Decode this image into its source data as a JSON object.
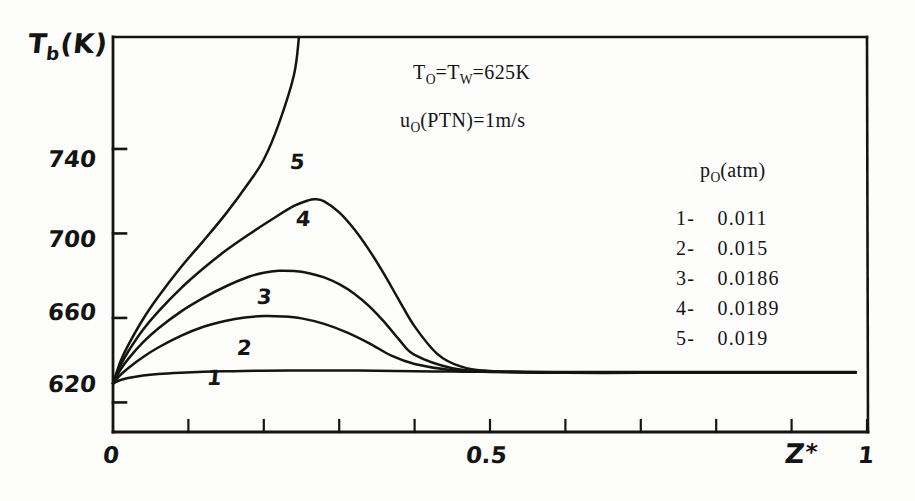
{
  "figure": {
    "background_color": "#fdfdfb",
    "ink_color": "#141414",
    "y_axis_title": "T",
    "y_axis_title_sub": "b",
    "y_axis_title_unit": "(K)",
    "x_axis_title": "Z",
    "x_axis_title_star": "*"
  },
  "annotations": {
    "line1_a": "T",
    "line1_sub_a": "O",
    "line1_b": "=T",
    "line1_sub_b": "W",
    "line1_c": "=625K",
    "line2_a": "u",
    "line2_sub_a": "O",
    "line2_b": "(PTN)=1m/s"
  },
  "legend": {
    "title_main": "p",
    "title_sub": "O",
    "title_unit": "(atm)",
    "rows": [
      {
        "key": "1-",
        "value": "0.011"
      },
      {
        "key": "2-",
        "value": "0.015"
      },
      {
        "key": "3-",
        "value": "0.0186"
      },
      {
        "key": "4-",
        "value": "0.0189"
      },
      {
        "key": "5-",
        "value": "0.019"
      }
    ]
  },
  "curve_labels": [
    {
      "id": "1",
      "x": 207,
      "y": 368
    },
    {
      "id": "2",
      "x": 237,
      "y": 338
    },
    {
      "id": "3",
      "x": 257,
      "y": 287
    },
    {
      "id": "4",
      "x": 296,
      "y": 209
    },
    {
      "id": "5",
      "x": 290,
      "y": 152
    }
  ],
  "chart_data": {
    "type": "line",
    "title": "",
    "xlabel": "Z*",
    "ylabel": "Tb (K)",
    "xlim": [
      0,
      1
    ],
    "ylim": [
      606,
      793
    ],
    "grid": false,
    "legend_position": "right",
    "xticks": [
      0,
      0.1,
      0.2,
      0.3,
      0.4,
      0.5,
      0.6,
      0.7,
      0.8,
      0.9,
      1
    ],
    "xtick_labels": [
      "0",
      "",
      "",
      "",
      "",
      "0.5",
      "",
      "",
      "",
      "",
      "1"
    ],
    "yticks": [
      620,
      660,
      700,
      740
    ],
    "ytick_labels": [
      "620",
      "660",
      "700",
      "740"
    ],
    "series": [
      {
        "name": "1",
        "legend": "1- 0.011",
        "p0_atm": 0.011,
        "x": [
          0.0,
          0.01,
          0.02,
          0.04,
          0.06,
          0.09,
          0.12,
          0.16,
          0.2,
          0.25,
          0.3,
          0.35,
          0.4,
          0.45,
          0.5,
          0.6,
          0.7,
          0.8,
          0.9,
          0.985
        ],
        "y": [
          629.0,
          630.6,
          631.6,
          632.8,
          633.5,
          634.1,
          634.5,
          634.8,
          635.0,
          635.1,
          635.1,
          635.0,
          634.8,
          634.6,
          634.5,
          634.4,
          634.4,
          634.4,
          634.4,
          634.4
        ]
      },
      {
        "name": "2",
        "legend": "2- 0.015",
        "p0_atm": 0.015,
        "x": [
          0.0,
          0.01,
          0.02,
          0.04,
          0.06,
          0.09,
          0.12,
          0.15,
          0.175,
          0.2,
          0.225,
          0.25,
          0.28,
          0.31,
          0.34,
          0.37,
          0.4,
          0.45,
          0.5,
          0.6,
          0.7,
          0.8,
          0.9,
          0.985
        ],
        "y": [
          629.0,
          633.0,
          636.2,
          641.5,
          646.0,
          651.5,
          655.8,
          658.7,
          660.2,
          660.9,
          660.7,
          659.8,
          657.2,
          653.2,
          648.0,
          642.0,
          638.2,
          635.2,
          634.4,
          634.0,
          634.0,
          634.1,
          634.1,
          634.1
        ]
      },
      {
        "name": "3",
        "legend": "3- 0.0186",
        "p0_atm": 0.0186,
        "x": [
          0.0,
          0.01,
          0.02,
          0.04,
          0.06,
          0.09,
          0.12,
          0.15,
          0.18,
          0.2,
          0.22,
          0.24,
          0.26,
          0.28,
          0.3,
          0.32,
          0.34,
          0.36,
          0.38,
          0.4,
          0.45,
          0.5,
          0.6,
          0.7,
          0.8,
          0.9,
          0.985
        ],
        "y": [
          629.0,
          635.5,
          640.5,
          648.5,
          655.0,
          663.0,
          669.5,
          675.0,
          679.5,
          681.4,
          682.3,
          682.2,
          681.2,
          679.2,
          676.0,
          671.5,
          665.5,
          658.0,
          649.5,
          642.5,
          636.2,
          634.6,
          634.2,
          634.2,
          634.3,
          634.3,
          634.3
        ]
      },
      {
        "name": "4",
        "legend": "4- 0.0189",
        "p0_atm": 0.0189,
        "x": [
          0.0,
          0.01,
          0.02,
          0.04,
          0.06,
          0.09,
          0.12,
          0.15,
          0.18,
          0.21,
          0.24,
          0.26,
          0.268,
          0.28,
          0.3,
          0.32,
          0.34,
          0.36,
          0.38,
          0.4,
          0.43,
          0.46,
          0.5,
          0.6,
          0.7,
          0.8,
          0.9,
          0.985
        ],
        "y": [
          629.0,
          637.5,
          644.0,
          654.5,
          663.0,
          674.0,
          683.5,
          692.0,
          699.5,
          706.5,
          713.0,
          715.8,
          716.2,
          715.2,
          710.0,
          702.0,
          692.0,
          680.5,
          668.0,
          656.0,
          643.0,
          637.2,
          634.9,
          634.2,
          634.2,
          634.2,
          634.2,
          634.2
        ]
      },
      {
        "name": "5",
        "legend": "5- 0.019",
        "p0_atm": 0.019,
        "note": "rises off the top of the plot frame",
        "x": [
          0.0,
          0.01,
          0.02,
          0.04,
          0.06,
          0.09,
          0.12,
          0.15,
          0.18,
          0.2,
          0.22,
          0.24,
          0.2465
        ],
        "y": [
          629.0,
          639.5,
          647.0,
          659.5,
          670.0,
          684.0,
          696.5,
          709.5,
          724.0,
          735.0,
          752.0,
          775.0,
          792.5
        ]
      }
    ]
  }
}
